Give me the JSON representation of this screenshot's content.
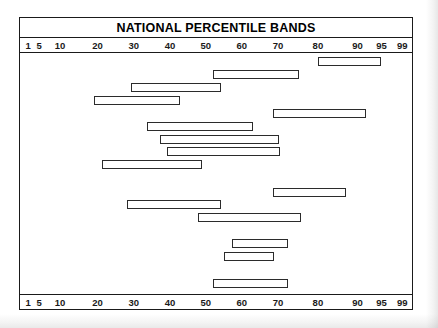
{
  "chart": {
    "title": "NATIONAL PERCENTILE BANDS"
  },
  "chart_data": {
    "type": "bar",
    "title": "NATIONAL PERCENTILE BANDS",
    "subtitle": "",
    "xlabel": "",
    "ylabel": "",
    "orientation": "horizontal",
    "grid": false,
    "legend": null,
    "scale_kind": "normal-percentile",
    "xlim": [
      1,
      99
    ],
    "tick_labels": [
      "1",
      "5",
      "10",
      "20",
      "30",
      "40",
      "50",
      "60",
      "70",
      "80",
      "90",
      "95",
      "99"
    ],
    "tick_values": [
      1,
      5,
      10,
      20,
      30,
      40,
      50,
      60,
      70,
      80,
      90,
      95,
      99
    ],
    "tick_positions_pct": [
      2.1,
      4.9,
      10.2,
      19.8,
      29.0,
      38.3,
      47.4,
      56.6,
      65.8,
      76.0,
      86.1,
      92.2,
      97.5
    ],
    "bands": [
      {
        "index": 1,
        "start": 80,
        "end": 95,
        "start_pct": 75.9,
        "end_pct": 92.1,
        "top_px": 4
      },
      {
        "index": 2,
        "start": 53,
        "end": 70,
        "start_pct": 49.2,
        "end_pct": 71.3,
        "top_px": 17
      },
      {
        "index": 3,
        "start": 30,
        "end": 51,
        "start_pct": 28.2,
        "end_pct": 51.3,
        "top_px": 30
      },
      {
        "index": 4,
        "start": 20,
        "end": 40,
        "start_pct": 18.8,
        "end_pct": 40.9,
        "top_px": 43
      },
      {
        "index": 5,
        "start": 66,
        "end": 90,
        "start_pct": 64.5,
        "end_pct": 88.3,
        "top_px": 56
      },
      {
        "index": 6,
        "start": 34,
        "end": 62,
        "start_pct": 32.5,
        "end_pct": 59.4,
        "top_px": 69
      },
      {
        "index": 7,
        "start": 37,
        "end": 68,
        "start_pct": 35.8,
        "end_pct": 66.0,
        "top_px": 82
      },
      {
        "index": 8,
        "start": 39,
        "end": 68,
        "start_pct": 37.6,
        "end_pct": 66.2,
        "top_px": 94
      },
      {
        "index": 9,
        "start": 22,
        "end": 48,
        "start_pct": 20.8,
        "end_pct": 46.4,
        "top_px": 107
      },
      {
        "index": 10,
        "start": 66,
        "end": 85,
        "start_pct": 64.5,
        "end_pct": 83.2,
        "top_px": 135
      },
      {
        "index": 11,
        "start": 29,
        "end": 51,
        "start_pct": 27.2,
        "end_pct": 51.3,
        "top_px": 147
      },
      {
        "index": 12,
        "start": 47,
        "end": 73,
        "start_pct": 45.4,
        "end_pct": 71.6,
        "top_px": 160
      },
      {
        "index": 13,
        "start": 56,
        "end": 70,
        "start_pct": 54.1,
        "end_pct": 68.3,
        "top_px": 186
      },
      {
        "index": 14,
        "start": 53,
        "end": 67,
        "start_pct": 52.0,
        "end_pct": 64.7,
        "top_px": 199
      },
      {
        "index": 15,
        "start": 50,
        "end": 70,
        "start_pct": 49.2,
        "end_pct": 68.3,
        "top_px": 226
      }
    ]
  }
}
